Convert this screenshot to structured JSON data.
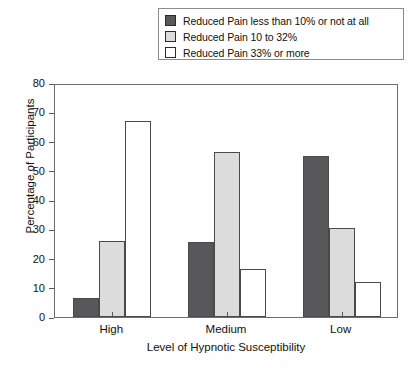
{
  "chart_data": {
    "type": "bar",
    "title": "",
    "xlabel": "Level of Hypnotic Susceptibility",
    "ylabel": "Percentage of Participants",
    "categories": [
      "High",
      "Medium",
      "Low"
    ],
    "ylim": [
      0,
      80
    ],
    "yticks": [
      0,
      10,
      20,
      30,
      40,
      50,
      60,
      70,
      80
    ],
    "grid": false,
    "legend_position": "top",
    "series": [
      {
        "name": "Reduced Pain less than 10% or not at all",
        "color": "#58585a",
        "values": [
          6.5,
          25.5,
          55
        ]
      },
      {
        "name": "Reduced Pain 10 to 32%",
        "color": "#dcdcdc",
        "values": [
          26,
          56.5,
          30.5
        ]
      },
      {
        "name": "Reduced Pain 33% or more",
        "color": "#ffffff",
        "values": [
          67,
          16.5,
          12
        ]
      }
    ]
  },
  "legend": {
    "items": [
      {
        "label": "Reduced Pain less than 10% or not at all",
        "swatch": "#58585a"
      },
      {
        "label": "Reduced Pain 10 to 32%",
        "swatch": "#dcdcdc"
      },
      {
        "label": "Reduced Pain 33% or more",
        "swatch": "#ffffff"
      }
    ]
  }
}
